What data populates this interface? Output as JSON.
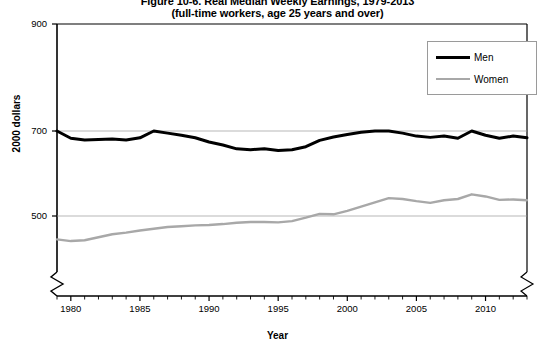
{
  "chart_data": {
    "type": "line",
    "title": "Figure 10-6. Real Median Weekly Earnings, 1979-2013",
    "subtitle": "(full-time workers, age 25 years and over)",
    "xlabel": "Year",
    "ylabel": "2000 dollars",
    "ylim": [
      420,
      900
    ],
    "yticks": [
      500,
      700,
      900
    ],
    "ytick_labels": [
      "500",
      "700",
      "900"
    ],
    "gridlines": [
      500,
      700
    ],
    "grid": true,
    "axis_break": true,
    "axis_break_note": "y-axis is broken below 500",
    "xlim": [
      1979,
      2013
    ],
    "xticks": [
      1980,
      1985,
      1990,
      1995,
      2000,
      2005,
      2010
    ],
    "xtick_labels": [
      "1980",
      "1985",
      "1990",
      "1995",
      "2000",
      "2005",
      "2010"
    ],
    "minor_xticks_every": 1,
    "legend_position": "top-right",
    "x": [
      1979,
      1980,
      1981,
      1982,
      1983,
      1984,
      1985,
      1986,
      1987,
      1988,
      1989,
      1990,
      1991,
      1992,
      1993,
      1994,
      1995,
      1996,
      1997,
      1998,
      1999,
      2000,
      2001,
      2002,
      2003,
      2004,
      2005,
      2006,
      2007,
      2008,
      2009,
      2010,
      2011,
      2012,
      2013
    ],
    "series": [
      {
        "name": "Men",
        "color": "#000000",
        "values": [
          700,
          683,
          679,
          680,
          681,
          679,
          684,
          700,
          695,
          690,
          684,
          674,
          667,
          658,
          656,
          658,
          654,
          656,
          663,
          678,
          686,
          692,
          697,
          700,
          700,
          695,
          688,
          685,
          688,
          683,
          700,
          690,
          683,
          688,
          684
        ]
      },
      {
        "name": "Women",
        "color": "#a8a8a8",
        "values": [
          445,
          441,
          443,
          450,
          457,
          461,
          466,
          470,
          474,
          476,
          478,
          479,
          481,
          484,
          486,
          486,
          485,
          488,
          496,
          505,
          504,
          512,
          522,
          532,
          542,
          540,
          535,
          531,
          537,
          540,
          551,
          546,
          538,
          539,
          537
        ]
      }
    ]
  },
  "legend": {
    "entries": [
      {
        "label": "Men"
      },
      {
        "label": "Women"
      }
    ]
  }
}
